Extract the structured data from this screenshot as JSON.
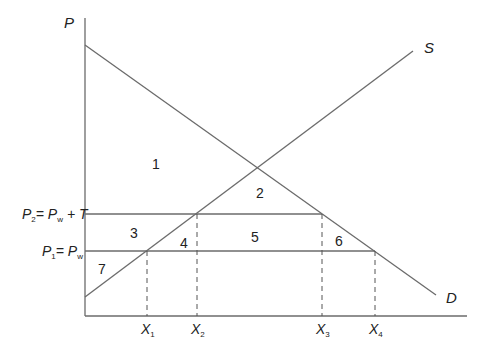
{
  "diagram": {
    "type": "supply-demand-tariff",
    "axes": {
      "y_label": "P",
      "x_label": ""
    },
    "curves": {
      "supply": "S",
      "demand": "D"
    },
    "price_levels": [
      {
        "name": "P2",
        "label_main": "P",
        "label_sub": "2",
        "label_eq": "= P",
        "label_eq_sub": "w",
        "label_tail": "+ T"
      },
      {
        "name": "P1",
        "label_main": "P",
        "label_sub": "1",
        "label_eq": "= P",
        "label_eq_sub": "w",
        "label_tail": ""
      }
    ],
    "quantities": [
      {
        "main": "X",
        "sub": "1"
      },
      {
        "main": "X",
        "sub": "2"
      },
      {
        "main": "X",
        "sub": "3"
      },
      {
        "main": "X",
        "sub": "4"
      }
    ],
    "regions": [
      "1",
      "2",
      "3",
      "4",
      "5",
      "6",
      "7"
    ]
  }
}
